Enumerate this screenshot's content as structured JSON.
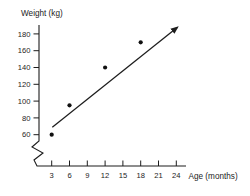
{
  "chart_data": {
    "type": "scatter",
    "title": "",
    "ylabel": "Weight (kg)",
    "xlabel": "Age (months)",
    "x_ticks": [
      3,
      6,
      9,
      12,
      15,
      18,
      21,
      24
    ],
    "y_ticks": [
      60,
      80,
      100,
      120,
      140,
      160,
      180
    ],
    "xlim": [
      3,
      24
    ],
    "ylim": [
      60,
      180
    ],
    "grid": false,
    "axis_break_y": true,
    "legend": null,
    "points": [
      {
        "x": 3,
        "y": 60
      },
      {
        "x": 6,
        "y": 95
      },
      {
        "x": 12,
        "y": 140
      },
      {
        "x": 18,
        "y": 170
      }
    ],
    "trend_line": {
      "x1": 3.1,
      "y1": 69,
      "x2": 24.2,
      "y2": 188,
      "arrow_end": true
    },
    "colors": {
      "ink": "#1d1d1d",
      "point": "#111111",
      "background": "#ffffff"
    }
  }
}
